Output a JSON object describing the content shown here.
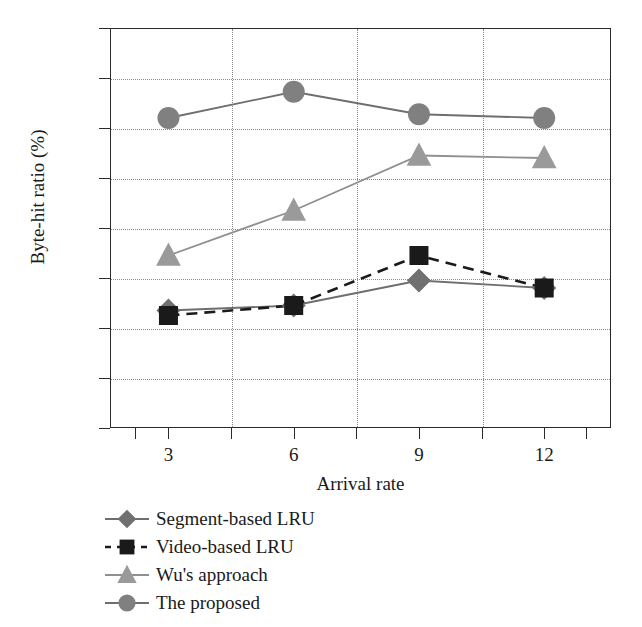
{
  "chart_data": {
    "type": "line",
    "title": "",
    "xlabel": "Arrival rate",
    "ylabel": "Byte-hit ratio (%)",
    "x": [
      3,
      6,
      9,
      12
    ],
    "xtick_labels": [
      "3",
      "6",
      "9",
      "12"
    ],
    "ytick_labels": [
      "48",
      "50",
      "52",
      "54",
      "56",
      "58",
      "60",
      "62",
      "64"
    ],
    "yticks": [
      48,
      50,
      52,
      54,
      56,
      58,
      60,
      62,
      64
    ],
    "xlim": [
      1.6,
      13.6
    ],
    "ylim": [
      48,
      64
    ],
    "grid": true,
    "legend_position": "below-left",
    "series": [
      {
        "name": "Segment-based LRU",
        "values": [
          52.7,
          52.9,
          53.9,
          53.6
        ],
        "marker": "diamond",
        "line_style": "solid",
        "color": "#707070",
        "line_color": "#6e6e6e"
      },
      {
        "name": "Video-based LRU",
        "values": [
          52.5,
          52.9,
          54.9,
          53.6
        ],
        "marker": "square",
        "line_style": "dashed",
        "color": "#1a1a1a",
        "line_color": "#1a1a1a"
      },
      {
        "name": "Wu's approach",
        "values": [
          54.9,
          56.7,
          58.9,
          58.8
        ],
        "marker": "triangle",
        "line_style": "solid",
        "color": "#9a9a9a",
        "line_color": "#8f8f8f"
      },
      {
        "name": "The proposed",
        "values": [
          60.4,
          61.45,
          60.55,
          60.4
        ],
        "marker": "circle",
        "line_style": "solid",
        "color": "#808080",
        "line_color": "#6e6e6e"
      }
    ],
    "axis_color": "#2b2b2b",
    "grid_color": "#8a8a8a",
    "background": "#ffffff"
  }
}
